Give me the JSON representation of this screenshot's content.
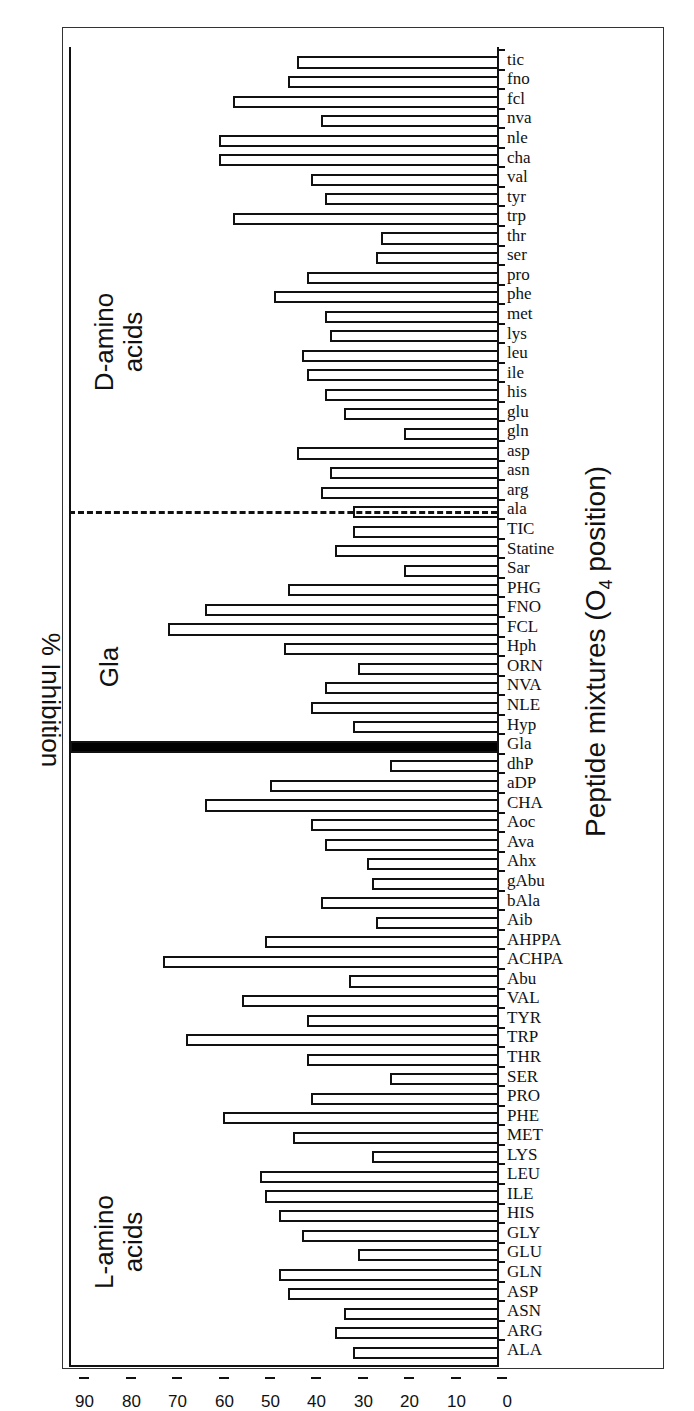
{
  "chart_data": {
    "type": "bar",
    "orientation": "vertical bars, figure rotated 90 degrees on page",
    "ylabel": "% Inhibition",
    "xlabel": "Peptide mixtures (O4 position)",
    "ylim": [
      0,
      90
    ],
    "yticks": [
      0,
      10,
      20,
      30,
      40,
      50,
      60,
      70,
      80,
      90
    ],
    "grid": false,
    "groups": [
      {
        "label": "L-amino acids",
        "range": [
          "ALA",
          "dhP"
        ]
      },
      {
        "label": "Gla",
        "range": [
          "Gla",
          "Gla"
        ]
      },
      {
        "label": "D-amino acids",
        "range": [
          "ala",
          "tic"
        ]
      }
    ],
    "categories": [
      "ALA",
      "ARG",
      "ASN",
      "ASP",
      "GLN",
      "GLU",
      "GLY",
      "HIS",
      "ILE",
      "LEU",
      "LYS",
      "MET",
      "PHE",
      "PRO",
      "SER",
      "THR",
      "TRP",
      "TYR",
      "VAL",
      "Abu",
      "ACHPA",
      "AHPPA",
      "Aib",
      "bAla",
      "gAbu",
      "Ahx",
      "Ava",
      "Aoc",
      "CHA",
      "aDP",
      "dhP",
      "Gla",
      "Hyp",
      "NLE",
      "NVA",
      "ORN",
      "Hph",
      "FCL",
      "FNO",
      "PHG",
      "Sar",
      "Statine",
      "TIC",
      "ala",
      "arg",
      "asn",
      "asp",
      "gln",
      "glu",
      "his",
      "ile",
      "leu",
      "lys",
      "met",
      "phe",
      "pro",
      "ser",
      "thr",
      "trp",
      "tyr",
      "val",
      "cha",
      "nle",
      "nva",
      "fcl",
      "fno",
      "tic"
    ],
    "values": [
      31,
      35,
      33,
      45,
      47,
      30,
      42,
      47,
      50,
      51,
      27,
      44,
      59,
      40,
      23,
      41,
      67,
      41,
      55,
      32,
      72,
      50,
      26,
      38,
      27,
      28,
      37,
      40,
      63,
      49,
      23,
      92,
      31,
      40,
      37,
      30,
      46,
      71,
      63,
      45,
      20,
      35,
      31,
      31,
      38,
      36,
      43,
      20,
      33,
      37,
      41,
      42,
      36,
      37,
      48,
      41,
      26,
      25,
      57,
      37,
      40,
      60,
      60,
      38,
      57,
      45,
      43
    ],
    "highlight": {
      "category": "Gla",
      "fill": "#000000"
    },
    "dividers": [
      {
        "after": "dhP",
        "style": "solid-thick"
      },
      {
        "after": "TIC",
        "style": "dashed"
      }
    ]
  },
  "labels": {
    "ytitle": "% Inhibition",
    "xtitle_main": "Peptide mixtures (O",
    "xtitle_sub": "4",
    "xtitle_end": " position)",
    "group_l_line1": "L-amino",
    "group_l_line2": "acids",
    "group_gla": "Gla",
    "group_d_line1": "D-amino",
    "group_d_line2": "acids"
  }
}
